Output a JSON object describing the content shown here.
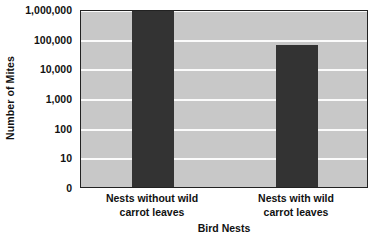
{
  "chart_data": {
    "type": "bar",
    "title": "",
    "subtitle": "",
    "xlabel": "Bird Nests",
    "ylabel": "Number of Mites",
    "categories": [
      "Nests without wild carrot leaves",
      "Nests with wild carrot leaves"
    ],
    "values": [
      900000,
      60000
    ],
    "series": [
      {
        "name": "Number of Mites",
        "values": [
          900000,
          60000
        ]
      }
    ],
    "yscale": "log",
    "ytick_labels": [
      "1,000,000",
      "100,000",
      "10,000",
      "1,000",
      "100",
      "10",
      "0"
    ],
    "ytick_values": [
      1000000,
      100000,
      10000,
      1000,
      100,
      10,
      0
    ],
    "ylim": [
      0,
      1000000
    ],
    "grid": true,
    "grid_orientation": "horizontal",
    "legend": false,
    "legend_position": "none",
    "bar_color": "#333333",
    "plot_background_color": "#c8c8c8",
    "gridline_color": "#fbfbfb",
    "axis_border_color": "#222222",
    "annotations": []
  },
  "category_label_lines": [
    [
      "Nests without wild",
      "carrot leaves"
    ],
    [
      "Nests with wild",
      "carrot leaves"
    ]
  ]
}
